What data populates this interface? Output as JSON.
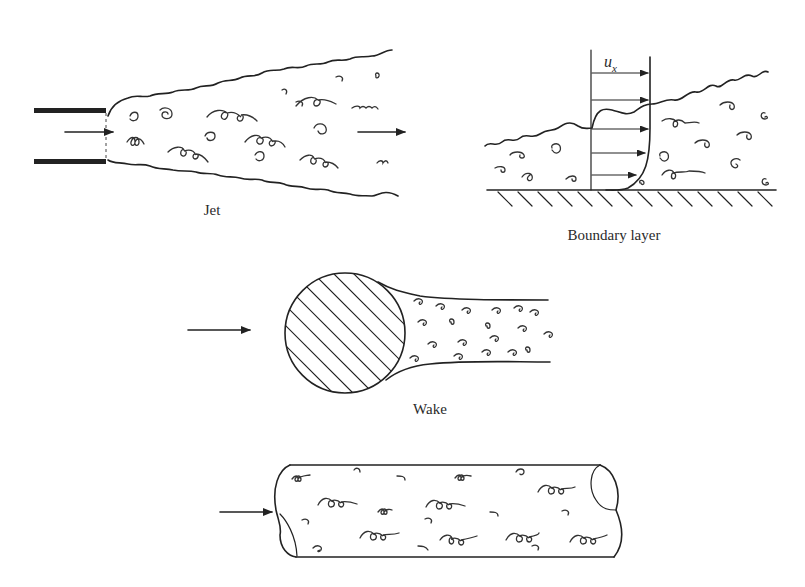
{
  "figure": {
    "panels": [
      {
        "id": "jet",
        "label": "Jet"
      },
      {
        "id": "boundary-layer",
        "label": "Boundary layer",
        "velocity_symbol": "u",
        "velocity_subscript": "x"
      },
      {
        "id": "wake",
        "label": "Wake"
      },
      {
        "id": "pipe-flow",
        "label": ""
      }
    ],
    "colors": {
      "ink": "#222222",
      "background": "#ffffff"
    }
  }
}
